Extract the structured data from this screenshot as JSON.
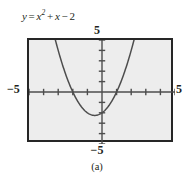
{
  "figure": {
    "caption": "(a)",
    "equation": {
      "lhs": "y",
      "equals": "=",
      "var1": "x",
      "exponent": "2",
      "plus": "+",
      "var2": "x",
      "minus": "−",
      "constant": "2",
      "full_text": "y = x² + x − 2"
    },
    "colors": {
      "frame_border": "#262626",
      "plot_fill": "#ededed",
      "curve": "#4d4d4d",
      "axis": "#4d4d4d",
      "text": "#231f20"
    }
  },
  "axis_labels": {
    "top": "5",
    "bottom": "−5",
    "left": "−5",
    "right": "5"
  },
  "chart_data": {
    "type": "line",
    "subtitle": "(a)",
    "xlabel": "",
    "ylabel": "",
    "xlim": [
      -5,
      5
    ],
    "ylim": [
      -5,
      5
    ],
    "grid": false,
    "legend": "none",
    "xticks": [
      -5,
      -4,
      -3,
      -2,
      -1,
      0,
      1,
      2,
      3,
      4,
      5
    ],
    "yticks": [
      -5,
      -4,
      -3,
      -2,
      -1,
      0,
      1,
      2,
      3,
      4,
      5
    ],
    "xtick_labels": [
      "-5",
      "",
      "",
      "",
      "",
      "",
      "",
      "",
      "",
      "",
      "5"
    ],
    "ytick_labels": [
      "-5",
      "",
      "",
      "",
      "",
      "",
      "",
      "",
      "",
      "",
      "5"
    ],
    "annotations": [
      {
        "text": "5",
        "position": "top of y-axis, above frame"
      },
      {
        "text": "−5",
        "position": "bottom of y-axis, below frame"
      },
      {
        "text": "−5",
        "position": "left of x-axis, outside frame"
      },
      {
        "text": "5",
        "position": "right of x-axis, outside frame"
      }
    ],
    "series": [
      {
        "name": "y = x^2 + x - 2",
        "equation": "y = x^2 + x - 2",
        "roots": [
          -2,
          1
        ],
        "vertex": [
          -0.5,
          -2.25
        ],
        "y_intercept": -2,
        "x": [
          -2.7,
          -2.5,
          -2.25,
          -2.0,
          -1.75,
          -1.5,
          -1.25,
          -1.0,
          -0.75,
          -0.5,
          -0.25,
          0.0,
          0.25,
          0.5,
          0.75,
          1.0,
          1.25,
          1.5,
          1.75,
          2.0,
          2.2
        ],
        "y": [
          4.59,
          3.75,
          2.31,
          0.0,
          -0.69,
          -1.25,
          -1.69,
          -2.0,
          -2.19,
          -2.25,
          -2.19,
          -2.0,
          -1.69,
          -1.25,
          -0.69,
          0.0,
          0.81,
          1.75,
          2.81,
          4.0,
          5.04
        ]
      }
    ]
  }
}
